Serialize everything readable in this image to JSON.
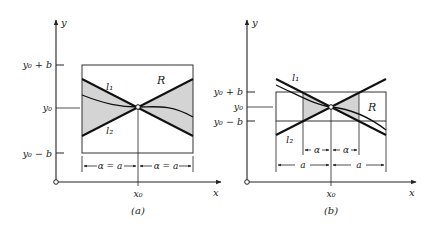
{
  "figure": {
    "panels": [
      {
        "id": "a",
        "caption": "(a)",
        "axis_x_label": "x",
        "axis_y_label": "y",
        "tick_y_top": "y₀ + b",
        "tick_y_mid": "y₀",
        "tick_y_bot": "y₀ − b",
        "tick_x": "x₀",
        "line1_label": "l₁",
        "line2_label": "l₂",
        "region_label": "R",
        "dim_left": "α = a",
        "dim_right": "α = a"
      },
      {
        "id": "b",
        "caption": "(b)",
        "axis_x_label": "x",
        "axis_y_label": "y",
        "tick_y_top": "y₀ + b",
        "tick_y_mid": "y₀",
        "tick_y_bot": "y₀ − b",
        "tick_x": "x₀",
        "line1_label": "l₁",
        "line2_label": "l₂",
        "region_label": "R",
        "dim_inner_left": "α",
        "dim_inner_right": "α",
        "dim_outer_left": "a",
        "dim_outer_right": "a"
      }
    ],
    "colors": {
      "ink": "#222222",
      "shade": "#d4d4d4"
    }
  }
}
